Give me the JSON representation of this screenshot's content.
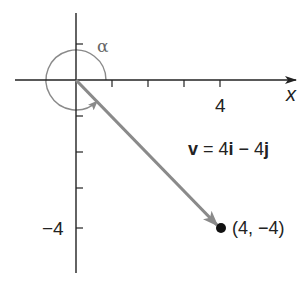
{
  "diagram": {
    "type": "vector-in-coordinate-plane",
    "origin_px": [
      76,
      80
    ],
    "unit_px": 36,
    "x_axis": {
      "name": "x",
      "tick_positions": [
        1,
        2,
        3,
        4
      ],
      "labeled_ticks": [
        {
          "value": 4,
          "label": "4"
        }
      ]
    },
    "y_axis": {
      "tick_positions": [
        1,
        -1,
        -2,
        -3,
        -4
      ],
      "labeled_ticks": [
        {
          "value": -4,
          "label": "−4"
        }
      ]
    },
    "vector": {
      "name": "v",
      "equation": {
        "lhs": "v",
        "eq": " = 4",
        "i": "i",
        "minus": " − 4",
        "j": "j"
      },
      "from": [
        0,
        0
      ],
      "to": [
        4,
        -4
      ],
      "color": "#8a8a8a"
    },
    "point": {
      "coords": [
        4,
        -4
      ],
      "label": "(4, −4)",
      "color": "#111111"
    },
    "angle": {
      "symbol": "α",
      "color": "#8a8a8a",
      "description": "angle measured counterclockwise from positive x-axis to v"
    }
  },
  "labels": {
    "x_tick_4": "4",
    "y_tick_neg4": "−4",
    "x_axis_name": "x",
    "alpha": "α",
    "point": "(4, −4)"
  }
}
